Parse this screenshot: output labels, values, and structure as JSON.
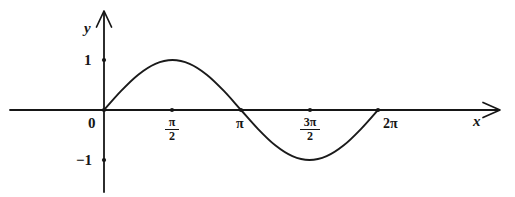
{
  "figure": {
    "background_color": "#ffffff",
    "ink_color": "#161616",
    "width": 515,
    "height": 197
  },
  "labels": {
    "y_axis": "y",
    "x_axis": "x",
    "origin": "0",
    "y_pos_one": "1",
    "y_neg_one": "−1",
    "tick_pi_over_2_num": "π",
    "tick_pi_over_2_den": "2",
    "tick_pi": "π",
    "tick_3pi_over_2_num": "3π",
    "tick_3pi_over_2_den": "2",
    "tick_2pi": "2π"
  },
  "chart_data": {
    "type": "line",
    "title": "",
    "xlabel": "x",
    "ylabel": "y",
    "function": "y = sin(x)",
    "grid": false,
    "legend": false,
    "xlim": [
      -0.45,
      5.85
    ],
    "ylim": [
      -1.6,
      1.75
    ],
    "xtick_values": [
      0,
      1.5708,
      3.14159,
      4.71239,
      6.28319
    ],
    "xtick_labels": [
      "0",
      "π/2",
      "π",
      "3π/2",
      "2π"
    ],
    "ytick_values": [
      -1,
      1
    ],
    "ytick_labels": [
      "−1",
      "1"
    ],
    "marked_points": [
      {
        "x": 0,
        "y": 0,
        "label": "0"
      },
      {
        "x": 1.5708,
        "y": 0,
        "label": "π/2"
      },
      {
        "x": 3.14159,
        "y": 0,
        "label": "π"
      },
      {
        "x": 4.71239,
        "y": 0,
        "label": "3π/2"
      },
      {
        "x": 6.28319,
        "y": 0,
        "label": "2π"
      },
      {
        "x": 0,
        "y": 1,
        "label": "1"
      },
      {
        "x": 0,
        "y": -1,
        "label": "−1"
      }
    ],
    "series": [
      {
        "name": "sin(x)",
        "x": [
          0,
          0.3927,
          0.7854,
          1.1781,
          1.5708,
          1.9635,
          2.3562,
          2.7489,
          3.14159,
          3.5343,
          3.927,
          4.3197,
          4.71239,
          5.1051,
          5.4978,
          5.8905,
          6.28319
        ],
        "values": [
          0,
          0.3827,
          0.7071,
          0.9239,
          1,
          0.9239,
          0.7071,
          0.3827,
          0,
          -0.3827,
          -0.7071,
          -0.9239,
          -1,
          -0.9239,
          -0.7071,
          -0.3827,
          0
        ]
      }
    ],
    "extrema": [
      {
        "type": "maximum",
        "x": 1.5708,
        "y": 1
      },
      {
        "type": "minimum",
        "x": 4.71239,
        "y": -1
      }
    ],
    "zeros": [
      0,
      3.14159,
      6.28319
    ]
  }
}
